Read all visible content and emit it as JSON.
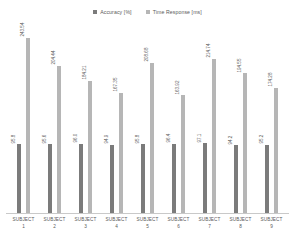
{
  "chart_data": {
    "type": "bar",
    "title": "",
    "subtitle": "",
    "xlabel": "",
    "ylabel": "",
    "grid": false,
    "legend_position": "top-center",
    "ylim": [
      0,
      260
    ],
    "categories": [
      "SUBJECT 1",
      "SUBJECT 2",
      "SUBJECT 3",
      "SUBJECT 4",
      "SUBJECT 5",
      "SUBJECT 6",
      "SUBJECT 7",
      "SUBJECT 8",
      "SUBJECT 9"
    ],
    "series": [
      {
        "name": "Accuracy [%]",
        "color": "#7b7b7b",
        "values": [
          95.8,
          95.6,
          96.0,
          94.9,
          95.8,
          96.4,
          97.1,
          94.2,
          95.2
        ]
      },
      {
        "name": "Time Response [ms]",
        "color": "#b6b6b6",
        "values": [
          243.54,
          204.44,
          184.21,
          167.35,
          208.68,
          163.92,
          214.74,
          194.55,
          174.28
        ]
      }
    ]
  },
  "legend": {
    "entries": [
      {
        "label": "Accuracy [%]",
        "color": "#7b7b7b"
      },
      {
        "label": "Time Response [ms]",
        "color": "#b6b6b6"
      }
    ]
  },
  "axis": {
    "categories": [
      {
        "name": "SUBJECT",
        "index": "1"
      },
      {
        "name": "SUBJECT",
        "index": "2"
      },
      {
        "name": "SUBJECT",
        "index": "3"
      },
      {
        "name": "SUBJECT",
        "index": "4"
      },
      {
        "name": "SUBJECT",
        "index": "5"
      },
      {
        "name": "SUBJECT",
        "index": "6"
      },
      {
        "name": "SUBJECT",
        "index": "7"
      },
      {
        "name": "SUBJECT",
        "index": "8"
      },
      {
        "name": "SUBJECT",
        "index": "9"
      }
    ]
  },
  "labels": {
    "accuracy": [
      "95.8",
      "95.6",
      "96.0",
      "94.9",
      "95.8",
      "96.4",
      "97.1",
      "94.2",
      "95.2"
    ],
    "time": [
      "243.54",
      "204.44",
      "184.21",
      "167.35",
      "208.68",
      "163.92",
      "214.74",
      "194.55",
      "174.28"
    ]
  }
}
